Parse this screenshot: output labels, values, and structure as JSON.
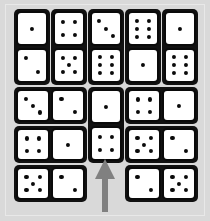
{
  "scene": {
    "title": "Domino grid puzzle",
    "background_color": "#d9d9d9",
    "frame_color": "#b8b8b8",
    "domino_body_color": "#111111",
    "domino_face_color": "#ffffff",
    "pip_color": "#0a0a0a",
    "arrow_color": "#808080"
  },
  "arrow": {
    "name": "up-arrow-pointer",
    "direction": "up",
    "color": "#808080",
    "x": 94,
    "y": 159,
    "width": 22,
    "height": 53
  },
  "dominoes": [
    {
      "id": "d1",
      "orientation": "vertical",
      "values": [
        1,
        2
      ],
      "x": 14,
      "y": 9,
      "w": 36,
      "h": 76
    },
    {
      "id": "d2",
      "orientation": "vertical",
      "values": [
        4,
        5
      ],
      "x": 51,
      "y": 9,
      "w": 36,
      "h": 76
    },
    {
      "id": "d3",
      "orientation": "vertical",
      "values": [
        3,
        6
      ],
      "x": 88,
      "y": 9,
      "w": 36,
      "h": 76
    },
    {
      "id": "d4",
      "orientation": "vertical",
      "values": [
        6,
        1
      ],
      "x": 125,
      "y": 9,
      "w": 36,
      "h": 76
    },
    {
      "id": "d5",
      "orientation": "vertical",
      "values": [
        1,
        6
      ],
      "x": 162,
      "y": 9,
      "w": 36,
      "h": 76
    },
    {
      "id": "d6",
      "orientation": "horizontal",
      "values": [
        3,
        2
      ],
      "x": 14,
      "y": 87,
      "w": 73,
      "h": 37
    },
    {
      "id": "d7",
      "orientation": "vertical",
      "values": [
        1,
        4
      ],
      "x": 88,
      "y": 87,
      "w": 36,
      "h": 76
    },
    {
      "id": "d8",
      "orientation": "horizontal",
      "values": [
        4,
        1
      ],
      "x": 125,
      "y": 87,
      "w": 73,
      "h": 37
    },
    {
      "id": "d9",
      "orientation": "horizontal",
      "values": [
        4,
        1
      ],
      "x": 14,
      "y": 126,
      "w": 73,
      "h": 37
    },
    {
      "id": "d10",
      "orientation": "horizontal",
      "values": [
        5,
        2
      ],
      "x": 125,
      "y": 126,
      "w": 73,
      "h": 37
    },
    {
      "id": "d11",
      "orientation": "horizontal",
      "values": [
        5,
        2
      ],
      "x": 14,
      "y": 165,
      "w": 73,
      "h": 37
    },
    {
      "id": "d12",
      "orientation": "horizontal",
      "values": [
        2,
        5
      ],
      "x": 125,
      "y": 165,
      "w": 73,
      "h": 37
    }
  ],
  "pip_layouts": {
    "1": [
      [
        50,
        50
      ]
    ],
    "2": [
      [
        28,
        28
      ],
      [
        72,
        72
      ]
    ],
    "3": [
      [
        26,
        26
      ],
      [
        50,
        50
      ],
      [
        74,
        74
      ]
    ],
    "4": [
      [
        29,
        29
      ],
      [
        71,
        29
      ],
      [
        29,
        71
      ],
      [
        71,
        71
      ]
    ],
    "5": [
      [
        28,
        28
      ],
      [
        72,
        28
      ],
      [
        50,
        50
      ],
      [
        28,
        72
      ],
      [
        72,
        72
      ]
    ],
    "6": [
      [
        29,
        24
      ],
      [
        71,
        24
      ],
      [
        29,
        50
      ],
      [
        71,
        50
      ],
      [
        29,
        76
      ],
      [
        71,
        76
      ]
    ]
  }
}
